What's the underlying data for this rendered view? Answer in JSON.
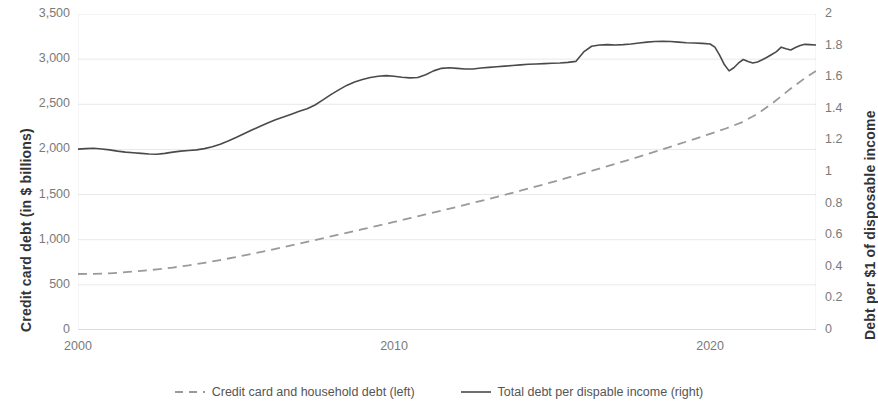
{
  "chart_data": {
    "type": "line",
    "title": "",
    "xlabel": "",
    "ylabel": "Credit card debt (in $ billions)",
    "ylabel_right": "Debt per $1 of disposable income",
    "grid": true,
    "legend_position": "bottom",
    "xlim": [
      2000,
      2023.35
    ],
    "xticks": [
      2000,
      2010,
      2020
    ],
    "xticklabels": [
      "2000",
      "2010",
      "2020"
    ],
    "ylim": [
      0,
      3500
    ],
    "yticks": [
      0,
      500,
      1000,
      1500,
      2000,
      2500,
      3000,
      3500
    ],
    "yticklabels": [
      "0",
      "500",
      "1,000",
      "1,500",
      "2,000",
      "2,500",
      "3,000",
      "3,500"
    ],
    "ylim_right": [
      0,
      2
    ],
    "yticks_right": [
      0,
      0.2,
      0.4,
      0.6,
      0.8,
      1,
      1.2,
      1.4,
      1.6,
      1.8,
      2
    ],
    "yticklabels_right": [
      "0",
      "0.2",
      "0.4",
      "0.6",
      "0.8",
      "1",
      "1.2",
      "1.4",
      "1.6",
      "1.8",
      "2"
    ],
    "series": [
      {
        "name": "Credit card and household debt (left)",
        "axis": "left",
        "style": "dashed",
        "color": "#9a9a9a",
        "x": [
          2000.0,
          2000.5,
          2001.0,
          2001.5,
          2002.0,
          2002.5,
          2003.0,
          2003.5,
          2004.0,
          2004.5,
          2005.0,
          2005.5,
          2006.0,
          2006.5,
          2007.0,
          2007.5,
          2008.0,
          2008.5,
          2009.0,
          2009.5,
          2010.0,
          2010.5,
          2011.0,
          2011.5,
          2012.0,
          2012.5,
          2013.0,
          2013.5,
          2014.0,
          2014.5,
          2015.0,
          2015.5,
          2016.0,
          2016.5,
          2017.0,
          2017.5,
          2018.0,
          2018.5,
          2019.0,
          2019.5,
          2020.0,
          2020.5,
          2021.0,
          2021.5,
          2022.0,
          2022.5,
          2023.0,
          2023.35
        ],
        "values": [
          620,
          622,
          628,
          640,
          655,
          672,
          692,
          716,
          744,
          775,
          808,
          843,
          880,
          918,
          957,
          996,
          1036,
          1076,
          1116,
          1156,
          1197,
          1238,
          1280,
          1322,
          1365,
          1408,
          1452,
          1497,
          1543,
          1590,
          1638,
          1687,
          1737,
          1788,
          1840,
          1893,
          1947,
          2002,
          2058,
          2115,
          2173,
          2232,
          2300,
          2395,
          2520,
          2660,
          2790,
          2870
        ]
      },
      {
        "name": "Total debt per dispable income (right)",
        "axis": "right",
        "style": "solid",
        "color": "#4a4a4a",
        "x": [
          2000.0,
          2000.25,
          2000.5,
          2000.75,
          2001.0,
          2001.25,
          2001.5,
          2001.75,
          2002.0,
          2002.25,
          2002.5,
          2002.75,
          2003.0,
          2003.25,
          2003.5,
          2003.75,
          2004.0,
          2004.25,
          2004.5,
          2004.75,
          2005.0,
          2005.25,
          2005.5,
          2005.75,
          2006.0,
          2006.25,
          2006.5,
          2006.75,
          2007.0,
          2007.25,
          2007.5,
          2007.75,
          2008.0,
          2008.25,
          2008.5,
          2008.75,
          2009.0,
          2009.25,
          2009.5,
          2009.75,
          2010.0,
          2010.25,
          2010.5,
          2010.75,
          2011.0,
          2011.25,
          2011.5,
          2011.75,
          2012.0,
          2012.25,
          2012.5,
          2012.75,
          2013.0,
          2013.25,
          2013.5,
          2013.75,
          2014.0,
          2014.25,
          2014.5,
          2014.75,
          2015.0,
          2015.25,
          2015.5,
          2015.75,
          2016.0,
          2016.25,
          2016.5,
          2016.75,
          2017.0,
          2017.25,
          2017.5,
          2017.75,
          2018.0,
          2018.25,
          2018.5,
          2018.75,
          2019.0,
          2019.25,
          2019.5,
          2019.75,
          2020.0,
          2020.15,
          2020.3,
          2020.45,
          2020.6,
          2020.75,
          2020.9,
          2021.05,
          2021.2,
          2021.35,
          2021.5,
          2021.65,
          2021.8,
          2021.95,
          2022.1,
          2022.25,
          2022.4,
          2022.55,
          2022.7,
          2022.85,
          2023.0,
          2023.15,
          2023.35
        ],
        "values": [
          1.145,
          1.148,
          1.15,
          1.146,
          1.14,
          1.132,
          1.126,
          1.122,
          1.118,
          1.114,
          1.112,
          1.118,
          1.126,
          1.132,
          1.136,
          1.14,
          1.148,
          1.16,
          1.176,
          1.196,
          1.218,
          1.242,
          1.266,
          1.288,
          1.31,
          1.33,
          1.348,
          1.366,
          1.384,
          1.4,
          1.424,
          1.456,
          1.49,
          1.52,
          1.548,
          1.57,
          1.586,
          1.598,
          1.606,
          1.61,
          1.606,
          1.6,
          1.596,
          1.598,
          1.616,
          1.64,
          1.656,
          1.66,
          1.656,
          1.652,
          1.652,
          1.658,
          1.662,
          1.666,
          1.67,
          1.674,
          1.678,
          1.682,
          1.684,
          1.686,
          1.688,
          1.69,
          1.694,
          1.7,
          1.76,
          1.796,
          1.804,
          1.806,
          1.804,
          1.806,
          1.81,
          1.816,
          1.822,
          1.826,
          1.828,
          1.826,
          1.822,
          1.818,
          1.816,
          1.814,
          1.81,
          1.79,
          1.74,
          1.68,
          1.64,
          1.66,
          1.69,
          1.712,
          1.7,
          1.69,
          1.696,
          1.71,
          1.726,
          1.744,
          1.762,
          1.79,
          1.78,
          1.772,
          1.788,
          1.8,
          1.808,
          1.806,
          1.804
        ]
      }
    ],
    "legend": [
      {
        "label": "Credit card and household debt (left)",
        "style": "dashed",
        "color": "#9a9a9a"
      },
      {
        "label": "Total debt per dispable income (right)",
        "style": "solid",
        "color": "#4a4a4a"
      }
    ]
  }
}
